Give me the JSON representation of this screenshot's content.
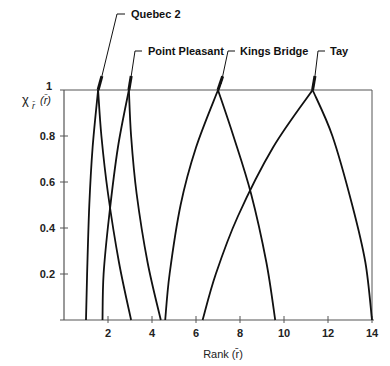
{
  "chart_data": {
    "type": "line",
    "title": "",
    "xlabel": "Rank (r̄)",
    "ylabel": "χ",
    "ylabel_subscript": "r̄",
    "ylabel_argument": "(r̄)",
    "xlim": [
      0,
      14
    ],
    "ylim": [
      0,
      1
    ],
    "grid": false,
    "legend": "inline leader-line labels above curves",
    "x_ticks": [
      2,
      4,
      6,
      8,
      10,
      12,
      14
    ],
    "x_tick_labels": [
      "2",
      "4",
      "6",
      "8",
      "10",
      "12",
      "14"
    ],
    "y_ticks": [
      0.2,
      0.4,
      0.6,
      0.8,
      1
    ],
    "y_tick_labels": [
      "0.2",
      "0.4",
      "0.6",
      "0.8",
      "1"
    ],
    "series": [
      {
        "name": "Quebec 2",
        "peak_rank": 1.55,
        "points": [
          [
            1.0,
            0
          ],
          [
            1.05,
            0.2
          ],
          [
            1.15,
            0.5
          ],
          [
            1.3,
            0.75
          ],
          [
            1.55,
            1.0
          ],
          [
            1.7,
            0.8
          ],
          [
            2.0,
            0.55
          ],
          [
            2.5,
            0.25
          ],
          [
            3.05,
            0
          ]
        ],
        "label_pos": [
          131,
          14
        ],
        "leader": [
          [
            125,
            14
          ],
          [
            117,
            14
          ],
          [
            100,
            84
          ]
        ]
      },
      {
        "name": "Point Pleasant",
        "peak_rank": 2.95,
        "points": [
          [
            1.75,
            0
          ],
          [
            1.8,
            0.2
          ],
          [
            2.05,
            0.45
          ],
          [
            2.45,
            0.75
          ],
          [
            2.95,
            1.0
          ],
          [
            3.05,
            0.8
          ],
          [
            3.3,
            0.55
          ],
          [
            3.8,
            0.25
          ],
          [
            4.4,
            0
          ]
        ],
        "label_pos": [
          148,
          51
        ],
        "leader": [
          [
            142,
            51
          ],
          [
            135,
            51
          ],
          [
            130,
            84
          ]
        ]
      },
      {
        "name": "Kings Bridge",
        "peak_rank": 7.0,
        "points": [
          [
            4.6,
            0
          ],
          [
            4.8,
            0.2
          ],
          [
            5.3,
            0.5
          ],
          [
            6.0,
            0.75
          ],
          [
            7.0,
            1.0
          ],
          [
            7.7,
            0.8
          ],
          [
            8.5,
            0.55
          ],
          [
            9.2,
            0.25
          ],
          [
            9.6,
            0
          ]
        ],
        "label_pos": [
          240,
          51
        ],
        "leader": [
          [
            235,
            51
          ],
          [
            228,
            51
          ],
          [
            221,
            84
          ]
        ]
      },
      {
        "name": "Tay",
        "peak_rank": 11.3,
        "points": [
          [
            6.3,
            0
          ],
          [
            6.9,
            0.2
          ],
          [
            7.9,
            0.45
          ],
          [
            9.5,
            0.75
          ],
          [
            11.3,
            1.0
          ],
          [
            12.2,
            0.8
          ],
          [
            13.1,
            0.5
          ],
          [
            13.7,
            0.25
          ],
          [
            14.0,
            0
          ]
        ],
        "label_pos": [
          330,
          51
        ],
        "leader": [
          [
            325,
            51
          ],
          [
            318,
            51
          ],
          [
            314,
            84
          ]
        ]
      }
    ]
  },
  "plot": {
    "origin_px": [
      64,
      320
    ],
    "px_per_x": 22,
    "px_per_y": 230,
    "line_color": "#111111",
    "axis_color": "#555555"
  }
}
